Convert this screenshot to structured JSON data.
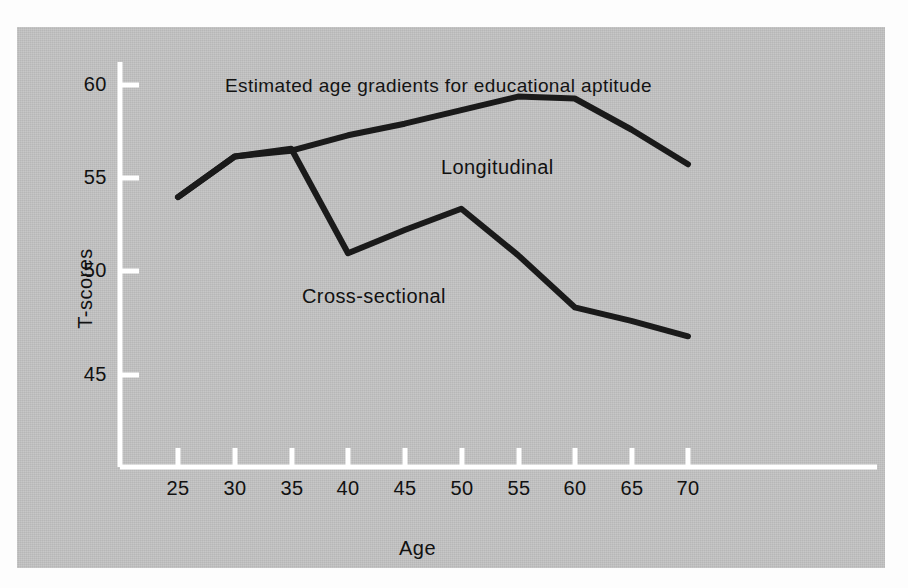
{
  "chart_data": {
    "type": "line",
    "title": "Estimated age gradients for educational aptitude",
    "xlabel": "Age",
    "ylabel": "T-scores",
    "xlim": [
      22,
      74
    ],
    "ylim": [
      42,
      61.5
    ],
    "xticks": [
      25,
      30,
      35,
      40,
      45,
      50,
      55,
      60,
      65,
      70
    ],
    "yticks": [
      45,
      50,
      55,
      60
    ],
    "grid": false,
    "legend_position": "inline-annotation",
    "series": [
      {
        "name": "Longitudinal",
        "x": [
          25,
          30,
          35,
          40,
          45,
          50,
          55,
          60,
          65,
          70
        ],
        "values": [
          54.2,
          56.3,
          56.6,
          57.4,
          58.0,
          58.7,
          59.4,
          59.3,
          57.7,
          55.9
        ]
      },
      {
        "name": "Cross-sectional",
        "x": [
          25,
          30,
          35,
          40,
          45,
          50,
          55,
          60,
          65,
          70
        ],
        "values": [
          54.2,
          56.3,
          56.7,
          51.3,
          52.5,
          53.6,
          51.2,
          48.5,
          47.8,
          47.0
        ]
      }
    ],
    "annotations": [
      {
        "text": "Longitudinal",
        "x": 60,
        "y": 57.0
      },
      {
        "text": "Cross-sectional",
        "x": 35,
        "y": 50.5
      }
    ]
  },
  "colors": {
    "panel_background": "#c3c3c3",
    "axis": "#ffffff",
    "line": "#1a1a1a",
    "text": "#111111",
    "page_background": "#fdfdfd"
  },
  "axis": {
    "y_tick_labels": [
      "60",
      "55",
      "50",
      "45"
    ],
    "x_tick_labels": [
      "25",
      "30",
      "35",
      "40",
      "45",
      "50",
      "55",
      "60",
      "65",
      "70"
    ],
    "y_title": "T-scores",
    "x_title": "Age"
  },
  "labels": {
    "title": "Estimated age gradients for educational aptitude",
    "longitudinal": "Longitudinal",
    "cross_sectional": "Cross-sectional"
  }
}
